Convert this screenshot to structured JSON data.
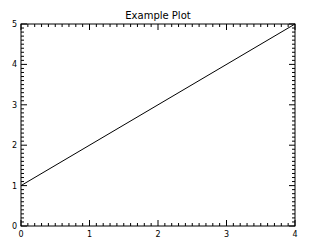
{
  "chart_data": {
    "type": "line",
    "title": "Example Plot",
    "xlabel": "",
    "ylabel": "",
    "xlim": [
      0,
      4
    ],
    "ylim": [
      0,
      5
    ],
    "x_ticks": [
      0,
      1,
      2,
      3,
      4
    ],
    "y_ticks": [
      0,
      1,
      2,
      3,
      4,
      5
    ],
    "x_tick_labels": [
      "0",
      "1",
      "2",
      "3",
      "4"
    ],
    "y_tick_labels": [
      "0",
      "1",
      "2",
      "3",
      "4",
      "5"
    ],
    "minor_ticks_per_major": 10,
    "grid": false,
    "series": [
      {
        "name": "line",
        "x": [
          0,
          4
        ],
        "y": [
          1,
          5
        ],
        "color": "#000000"
      }
    ]
  }
}
